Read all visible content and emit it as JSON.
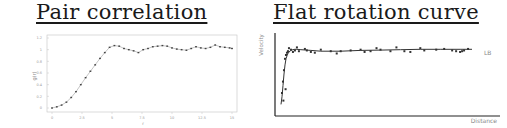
{
  "titles": {
    "left": "Pair correlation",
    "right": "Flat rotation curve"
  },
  "chart_data": [
    {
      "type": "scatter",
      "title": "Pair correlation",
      "xlabel": "r",
      "ylabel": "g(r)",
      "xlim": [
        0,
        15
      ],
      "ylim": [
        0,
        1.2
      ],
      "grid": false,
      "x_ticks": [
        "0",
        "2.5",
        "5",
        "7.5",
        "10",
        "12.5",
        "15"
      ],
      "y_ticks": [
        "0",
        "0.2",
        "0.4",
        "0.6",
        "0.8",
        "1",
        "1.2"
      ],
      "colors": {
        "axis": "#bbbbbb",
        "marker": "#444444",
        "line": "#777777"
      },
      "x": [
        0,
        0.4,
        0.8,
        1.2,
        1.6,
        2.0,
        2.4,
        2.8,
        3.2,
        3.6,
        4.0,
        4.4,
        4.8,
        5.2,
        5.6,
        6.0,
        6.4,
        6.8,
        7.2,
        7.6,
        8.0,
        8.4,
        8.8,
        9.2,
        9.6,
        10.0,
        10.4,
        10.8,
        11.2,
        11.6,
        12.0,
        12.4,
        12.8,
        13.2,
        13.6,
        14.0,
        14.4,
        14.8,
        15.0
      ],
      "y": [
        0.0,
        0.02,
        0.05,
        0.1,
        0.18,
        0.28,
        0.4,
        0.52,
        0.63,
        0.74,
        0.85,
        0.95,
        1.04,
        1.07,
        1.06,
        1.02,
        1.0,
        0.98,
        0.95,
        1.0,
        1.02,
        1.05,
        1.06,
        1.07,
        1.06,
        1.03,
        1.01,
        1.0,
        0.99,
        1.02,
        1.05,
        1.03,
        1.02,
        1.04,
        1.08,
        1.05,
        1.04,
        1.03,
        1.02
      ]
    },
    {
      "type": "scatter",
      "title": "Flat rotation curve",
      "xlabel": "Distance",
      "ylabel": "Velocity",
      "annotation": "LB",
      "xlim": [
        0,
        100
      ],
      "ylim": [
        0,
        100
      ],
      "grid": false,
      "colors": {
        "axis": "#222222",
        "marker": "#333333",
        "line": "#444444"
      },
      "curve_x": [
        0,
        0.5,
        1,
        1.5,
        2,
        2.5,
        3,
        3.5,
        4,
        5,
        6,
        7,
        8,
        10,
        15,
        20,
        30,
        40,
        50,
        60,
        70,
        80,
        90,
        96
      ],
      "curve_y": [
        10,
        20,
        35,
        50,
        62,
        70,
        74,
        77,
        79,
        81,
        82,
        82.5,
        82.5,
        82,
        81,
        80,
        80,
        81,
        81.5,
        82,
        82.5,
        82.5,
        82.5,
        82.5
      ],
      "points_x": [
        0.5,
        1,
        1.2,
        1.5,
        2,
        2.3,
        2.5,
        3,
        3.5,
        4,
        5,
        6,
        7,
        8,
        9,
        12,
        13,
        15,
        17,
        20,
        25,
        28,
        30,
        35,
        40,
        42,
        45,
        48,
        50,
        55,
        58,
        62,
        65,
        70,
        72,
        78,
        82,
        86,
        88,
        90,
        91,
        92,
        94
      ],
      "points_y": [
        25,
        40,
        15,
        55,
        70,
        30,
        75,
        78,
        80,
        84,
        82,
        79,
        81,
        85,
        80,
        83,
        81,
        79,
        78,
        82,
        80,
        77,
        80,
        81,
        82,
        79,
        80,
        84,
        82,
        80,
        85,
        80,
        79,
        84,
        81,
        82,
        83,
        81,
        80,
        79,
        80,
        81,
        83
      ]
    }
  ]
}
